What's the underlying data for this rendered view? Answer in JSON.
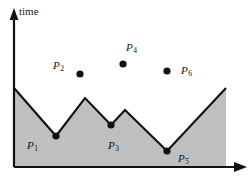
{
  "figure": {
    "axes": {
      "y_axis_label": "time",
      "x_axis_label": "",
      "y_axis": {
        "x": 14,
        "top": 10,
        "bottom": 167
      },
      "x_axis": {
        "y": 167,
        "left": 14,
        "right": 246
      }
    },
    "colors": {
      "fill": "#bfbfbf",
      "stroke": "#111111",
      "axis": "#111111",
      "text": "#141414",
      "background": "#ffffff"
    },
    "terrain": {
      "description": "shaded polygonal terrain profile",
      "outline_points": [
        [
          14,
          88
        ],
        [
          56,
          136
        ],
        [
          85,
          98
        ],
        [
          111,
          125
        ],
        [
          125,
          110
        ],
        [
          167,
          151
        ],
        [
          226,
          88
        ]
      ],
      "base_y": 167,
      "right_edge_x": 226
    },
    "valley_points": [
      {
        "id": "P1",
        "label": "P",
        "sub": "1",
        "dot_x": 56,
        "dot_y": 136,
        "label_x": 27,
        "label_y": 140,
        "dot_r": 3.6
      },
      {
        "id": "P3",
        "label": "P",
        "sub": "3",
        "dot_x": 111,
        "dot_y": 125,
        "label_x": 108,
        "label_y": 140,
        "dot_r": 3.6
      },
      {
        "id": "P5",
        "label": "P",
        "sub": "5",
        "dot_x": 167,
        "dot_y": 151,
        "label_x": 178,
        "label_y": 153,
        "dot_r": 3.6
      }
    ],
    "air_points": [
      {
        "id": "P2",
        "label": "P",
        "sub": "2",
        "dot_x": 80,
        "dot_y": 74,
        "label_x": 53,
        "label_y": 60,
        "dot_r": 3.6
      },
      {
        "id": "P4",
        "label": "P",
        "sub": "4",
        "dot_x": 123,
        "dot_y": 64,
        "label_x": 126,
        "label_y": 42,
        "dot_r": 3.6
      },
      {
        "id": "P6",
        "label": "P",
        "sub": "6",
        "dot_x": 167,
        "dot_y": 71,
        "label_x": 181,
        "label_y": 65,
        "dot_r": 3.6
      }
    ]
  },
  "chart_data": {
    "type": "area",
    "title": "",
    "xlabel": "",
    "ylabel": "time",
    "grid": false,
    "legend": null,
    "series": [
      {
        "name": "terrain-profile",
        "x": [
          14,
          56,
          85,
          111,
          125,
          167,
          226
        ],
        "y": [
          88,
          136,
          98,
          125,
          110,
          151,
          88
        ],
        "note": "pixel coordinates of polyline vertices; y increases downward"
      }
    ],
    "annotations": [
      {
        "text": "P1",
        "x": 56,
        "y": 136,
        "kind": "terrain-vertex-dot"
      },
      {
        "text": "P2",
        "x": 80,
        "y": 74,
        "kind": "free-space-dot"
      },
      {
        "text": "P3",
        "x": 111,
        "y": 125,
        "kind": "terrain-vertex-dot"
      },
      {
        "text": "P4",
        "x": 123,
        "y": 64,
        "kind": "free-space-dot"
      },
      {
        "text": "P5",
        "x": 167,
        "y": 151,
        "kind": "terrain-vertex-dot"
      },
      {
        "text": "P6",
        "x": 167,
        "y": 71,
        "kind": "free-space-dot"
      }
    ]
  }
}
